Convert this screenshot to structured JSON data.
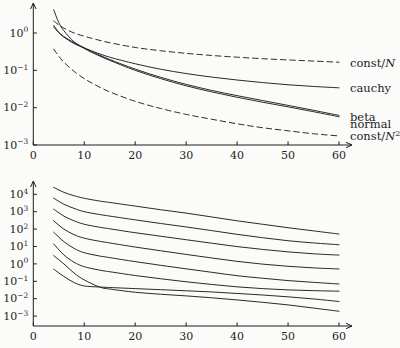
{
  "colors": {
    "ink": "#1e1e1e",
    "background": "#fbfbf9"
  },
  "chart_data": [
    {
      "id": "top-convergence",
      "type": "line",
      "title": "",
      "xlabel": "",
      "ylabel": "",
      "x_axis": {
        "range": [
          0,
          62
        ],
        "ticks": [
          {
            "v": 0,
            "label": "0"
          },
          {
            "v": 10,
            "label": "10"
          },
          {
            "v": 20,
            "label": "20"
          },
          {
            "v": 30,
            "label": "30"
          },
          {
            "v": 40,
            "label": "40"
          },
          {
            "v": 50,
            "label": "50"
          },
          {
            "v": 60,
            "label": "60"
          }
        ]
      },
      "y_axis": {
        "scale": "log",
        "base": "10",
        "ticks": [
          {
            "exp": 0,
            "label": "0"
          },
          {
            "exp": -1,
            "label": "−1"
          },
          {
            "exp": -2,
            "label": "−2"
          },
          {
            "exp": -3,
            "label": "−3"
          }
        ]
      },
      "series": [
        {
          "name": "const-over-N",
          "style": "dashed",
          "x": [
            4,
            5,
            6,
            8,
            10,
            12,
            15,
            20,
            25,
            30,
            35,
            40,
            45,
            50,
            55,
            60
          ],
          "v": [
            2.1,
            1.65,
            1.35,
            1.0,
            0.82,
            0.69,
            0.55,
            0.41,
            0.335,
            0.285,
            0.25,
            0.225,
            0.205,
            0.19,
            0.177,
            0.165
          ]
        },
        {
          "name": "cauchy",
          "style": "solid",
          "x": [
            4,
            5,
            6,
            8,
            10,
            12,
            15,
            20,
            25,
            30,
            35,
            40,
            45,
            50,
            55,
            60
          ],
          "v": [
            1.6,
            1.05,
            0.78,
            0.52,
            0.4,
            0.31,
            0.225,
            0.15,
            0.107,
            0.082,
            0.066,
            0.055,
            0.047,
            0.041,
            0.037,
            0.034
          ]
        },
        {
          "name": "beta",
          "style": "solid",
          "x": [
            4,
            5,
            6,
            8,
            10,
            12,
            15,
            20,
            25,
            30,
            35,
            40,
            45,
            50,
            55,
            60
          ],
          "v": [
            4.2,
            1.9,
            1.15,
            0.58,
            0.4,
            0.295,
            0.195,
            0.108,
            0.065,
            0.042,
            0.029,
            0.021,
            0.0155,
            0.0115,
            0.0085,
            0.0062
          ]
        },
        {
          "name": "normal",
          "style": "solid",
          "x": [
            4,
            5,
            6,
            8,
            10,
            12,
            15,
            20,
            25,
            30,
            35,
            40,
            45,
            50,
            55,
            60
          ],
          "v": [
            1.45,
            1.02,
            0.8,
            0.55,
            0.385,
            0.28,
            0.185,
            0.1,
            0.06,
            0.0385,
            0.0265,
            0.019,
            0.014,
            0.0105,
            0.0078,
            0.0057
          ]
        },
        {
          "name": "const-over-N-squared",
          "style": "dashed",
          "x": [
            4,
            5,
            6,
            8,
            10,
            12,
            15,
            20,
            25,
            30,
            35,
            40,
            45,
            50,
            55,
            60
          ],
          "v": [
            0.37,
            0.24,
            0.165,
            0.094,
            0.06,
            0.042,
            0.0265,
            0.0148,
            0.0095,
            0.0066,
            0.0049,
            0.0037,
            0.0029,
            0.0024,
            0.002,
            0.00175
          ]
        }
      ],
      "labels": [
        {
          "for": "const-over-N",
          "at_v": 0.158,
          "segments": [
            [
              "const/",
              "r"
            ],
            [
              "N",
              "i"
            ]
          ]
        },
        {
          "for": "cauchy",
          "at_v": 0.034,
          "segments": [
            [
              "cauchy",
              "r"
            ]
          ]
        },
        {
          "for": "beta",
          "at_v": 0.0056,
          "segments": [
            [
              "beta",
              "r"
            ]
          ]
        },
        {
          "for": "normal",
          "at_v": 0.0035,
          "segments": [
            [
              "normal",
              "r"
            ]
          ]
        },
        {
          "for": "const-over-N-squared",
          "at_v": 0.0017,
          "segments": [
            [
              "const/",
              "r"
            ],
            [
              "N",
              "i"
            ],
            [
              "2",
              "s"
            ]
          ]
        }
      ]
    },
    {
      "id": "bottom-family",
      "type": "line",
      "title": "",
      "xlabel": "",
      "ylabel": "",
      "x_axis": {
        "range": [
          0,
          62
        ],
        "ticks": [
          {
            "v": 0,
            "label": "0"
          },
          {
            "v": 10,
            "label": "10"
          },
          {
            "v": 20,
            "label": "20"
          },
          {
            "v": 30,
            "label": "30"
          },
          {
            "v": 40,
            "label": "40"
          },
          {
            "v": 50,
            "label": "50"
          },
          {
            "v": 60,
            "label": "60"
          }
        ]
      },
      "y_axis": {
        "scale": "log",
        "base": "10",
        "ticks": [
          {
            "exp": 4,
            "label": "4"
          },
          {
            "exp": 3,
            "label": "3"
          },
          {
            "exp": 2,
            "label": "2"
          },
          {
            "exp": 1,
            "label": "1"
          },
          {
            "exp": 0,
            "label": "0"
          },
          {
            "exp": -1,
            "label": "−1"
          },
          {
            "exp": -2,
            "label": "−2"
          },
          {
            "exp": -3,
            "label": "−3"
          }
        ]
      },
      "series": [
        {
          "name": "series-1",
          "style": "solid",
          "x": [
            4,
            6,
            8,
            10,
            13,
            15,
            20,
            25,
            30,
            35,
            40,
            45,
            50,
            55,
            60
          ],
          "v": [
            25000,
            13000,
            8300,
            5900,
            4100,
            3400,
            2100,
            1300,
            830,
            500,
            300,
            190,
            120,
            79,
            52
          ]
        },
        {
          "name": "series-2",
          "style": "solid",
          "x": [
            4,
            6,
            8,
            10,
            13,
            15,
            20,
            25,
            30,
            35,
            40,
            45,
            50,
            55,
            60
          ],
          "v": [
            6000,
            2700,
            1550,
            1000,
            690,
            560,
            340,
            210,
            133,
            82,
            50,
            32,
            21.5,
            16,
            12.6
          ]
        },
        {
          "name": "series-3",
          "style": "solid",
          "x": [
            4,
            6,
            8,
            10,
            13,
            15,
            20,
            25,
            30,
            35,
            40,
            45,
            50,
            55,
            60
          ],
          "v": [
            1400,
            560,
            300,
            190,
            128,
            104,
            62,
            39,
            24.5,
            15.5,
            9.9,
            6.8,
            4.9,
            3.8,
            3.2
          ]
        },
        {
          "name": "series-4",
          "style": "solid",
          "x": [
            4,
            6,
            8,
            10,
            13,
            15,
            20,
            25,
            30,
            35,
            40,
            45,
            50,
            55,
            60
          ],
          "v": [
            300,
            100,
            48,
            30,
            20,
            16,
            9.3,
            5.7,
            3.5,
            2.2,
            1.4,
            0.97,
            0.73,
            0.59,
            0.51
          ]
        },
        {
          "name": "series-5",
          "style": "solid",
          "x": [
            4,
            6,
            8,
            10,
            13,
            15,
            20,
            25,
            30,
            35,
            40,
            45,
            50,
            55,
            60
          ],
          "v": [
            66,
            19,
            7.8,
            4.4,
            2.85,
            2.3,
            1.35,
            0.83,
            0.52,
            0.33,
            0.21,
            0.15,
            0.11,
            0.087,
            0.07
          ]
        },
        {
          "name": "series-6",
          "style": "solid",
          "x": [
            4,
            6,
            8,
            10,
            13,
            15,
            20,
            25,
            30,
            35,
            40,
            45,
            50,
            55,
            60
          ],
          "v": [
            14,
            3.3,
            1.25,
            0.69,
            0.44,
            0.355,
            0.215,
            0.14,
            0.094,
            0.066,
            0.048,
            0.038,
            0.032,
            0.029,
            0.027
          ]
        },
        {
          "name": "series-7",
          "style": "solid",
          "x": [
            4,
            6,
            8,
            10,
            13,
            15,
            20,
            25,
            30,
            35,
            40,
            45,
            50,
            55,
            60
          ],
          "v": [
            0.5,
            0.19,
            0.085,
            0.054,
            0.047,
            0.044,
            0.038,
            0.033,
            0.0285,
            0.0245,
            0.02,
            0.0163,
            0.0128,
            0.0097,
            0.0069
          ]
        },
        {
          "name": "series-8",
          "style": "solid",
          "x": [
            4,
            6,
            8,
            10,
            13,
            15,
            20,
            25,
            30,
            35,
            40,
            45,
            50,
            55,
            60
          ],
          "v": [
            3.0,
            1.0,
            0.3,
            0.12,
            0.047,
            0.036,
            0.0235,
            0.018,
            0.0145,
            0.0113,
            0.0085,
            0.0062,
            0.0044,
            0.0029,
            0.0019
          ]
        }
      ],
      "labels": []
    }
  ]
}
